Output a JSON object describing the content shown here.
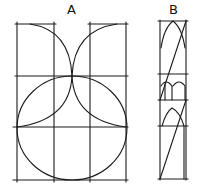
{
  "figure": {
    "labels": {
      "a": "A",
      "b": "B"
    },
    "stroke_color": "#1a1a1a",
    "background": "#ffffff"
  },
  "panel_a": {
    "description": "Grid with a large circle and two quarter-arcs meeting at top center",
    "verticals_x": [
      17,
      54,
      90,
      126
    ],
    "horizontals_y": [
      24,
      76,
      127,
      180
    ],
    "circle": {
      "cx": 72,
      "cy": 128,
      "rx": 55,
      "ry": 52
    },
    "arcs": [
      "left-quarter-arc",
      "right-quarter-arc"
    ]
  },
  "panel_b": {
    "description": "Narrow tall panel with gothic pointed arches and diagonals",
    "frame_x": [
      160,
      186
    ],
    "horizontals_y": [
      21,
      74,
      100,
      126,
      180
    ],
    "elements": [
      "upper-pointed-arch",
      "middle-double-arch",
      "lower-pointed-arch",
      "diagonals"
    ]
  }
}
